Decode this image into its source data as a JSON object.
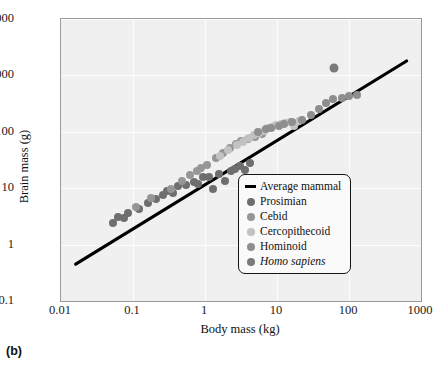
{
  "panel_label": "(b)",
  "chart_data": {
    "type": "scatter",
    "title": "",
    "xlabel": "Body mass (kg)",
    "ylabel": "Brain mass (g)",
    "xscale": "log",
    "yscale": "log",
    "xlim": [
      0.01,
      1000
    ],
    "ylim": [
      0.1,
      10000
    ],
    "xticks": [
      "0.01",
      "0.1",
      "1",
      "10",
      "100",
      "1000"
    ],
    "xtick_values": [
      0.01,
      0.1,
      1,
      10,
      100,
      1000
    ],
    "yticks": [
      "0.1",
      "1",
      "10",
      "100",
      "1,000",
      "10,000"
    ],
    "ytick_values": [
      0.1,
      1,
      10,
      100,
      1000,
      10000
    ],
    "grid": true,
    "legend_position": "bottom-right",
    "legend": [
      {
        "label": "Average mammal",
        "marker": "line",
        "color": "#000000"
      },
      {
        "label": "Prosimian",
        "marker": "circle",
        "color": "#6e6e6e"
      },
      {
        "label": "Cebid",
        "marker": "circle",
        "color": "#969696"
      },
      {
        "label": "Cercopithecoid",
        "marker": "circle",
        "color": "#c2c2c2"
      },
      {
        "label": "Hominoid",
        "marker": "circle",
        "color": "#8e8e8e"
      },
      {
        "label": "Homo sapiens",
        "marker": "circle",
        "color": "#7a7a7a",
        "italic": true
      }
    ],
    "trendline": {
      "name": "Average mammal",
      "color": "#000000",
      "x": [
        0.016,
        631
      ],
      "y": [
        0.45,
        1800
      ]
    },
    "series": [
      {
        "name": "Prosimian",
        "color": "#6e6e6e",
        "points": [
          [
            0.052,
            2.4
          ],
          [
            0.061,
            3.1
          ],
          [
            0.075,
            3.0
          ],
          [
            0.085,
            3.6
          ],
          [
            0.12,
            4.2
          ],
          [
            0.16,
            5.5
          ],
          [
            0.21,
            6.4
          ],
          [
            0.26,
            7.6
          ],
          [
            0.3,
            9.0
          ],
          [
            0.36,
            8.3
          ],
          [
            0.42,
            11.0
          ],
          [
            0.55,
            11.5
          ],
          [
            0.7,
            13.0
          ],
          [
            0.8,
            12.0
          ],
          [
            0.95,
            15.5
          ],
          [
            1.15,
            16.0
          ],
          [
            1.3,
            9.5
          ],
          [
            1.55,
            18.0
          ],
          [
            1.9,
            13.5
          ],
          [
            2.3,
            20.0
          ],
          [
            2.6,
            22.0
          ],
          [
            3.1,
            25.0
          ],
          [
            3.6,
            21.0
          ],
          [
            4.2,
            28.0
          ]
        ]
      },
      {
        "name": "Cebid",
        "color": "#969696",
        "points": [
          [
            0.11,
            4.6
          ],
          [
            0.18,
            6.8
          ],
          [
            0.34,
            9.5
          ],
          [
            0.48,
            13.5
          ],
          [
            0.62,
            17.0
          ],
          [
            0.78,
            20.0
          ],
          [
            0.88,
            23.0
          ],
          [
            1.05,
            26.0
          ],
          [
            1.4,
            34.0
          ],
          [
            1.8,
            42.0
          ],
          [
            2.2,
            52.0
          ],
          [
            2.7,
            60.0
          ],
          [
            3.2,
            68.0
          ],
          [
            3.9,
            74.0
          ],
          [
            5.0,
            82.0
          ],
          [
            6.2,
            90.0
          ]
        ]
      },
      {
        "name": "Cercopithecoid",
        "color": "#c2c2c2",
        "points": [
          [
            1.6,
            38.0
          ],
          [
            2.1,
            48.0
          ],
          [
            2.8,
            58.0
          ],
          [
            3.4,
            66.0
          ],
          [
            4.1,
            78.0
          ],
          [
            4.8,
            88.0
          ],
          [
            5.6,
            96.0
          ],
          [
            6.5,
            105.0
          ],
          [
            7.4,
            115.0
          ],
          [
            8.6,
            122.0
          ],
          [
            9.8,
            130.0
          ],
          [
            11.5,
            135.0
          ],
          [
            13.0,
            142.0
          ],
          [
            15.0,
            150.0
          ],
          [
            17.5,
            128.0
          ],
          [
            20.0,
            155.0
          ]
        ]
      },
      {
        "name": "Hominoid",
        "color": "#8e8e8e",
        "points": [
          [
            5.4,
            98.0
          ],
          [
            7.0,
            110.0
          ],
          [
            8.2,
            118.0
          ],
          [
            10.5,
            126.0
          ],
          [
            12.5,
            140.0
          ],
          [
            16.0,
            152.0
          ],
          [
            22.0,
            165.0
          ],
          [
            30.0,
            200.0
          ],
          [
            38.0,
            250.0
          ],
          [
            48.0,
            320.0
          ],
          [
            60.0,
            380.0
          ],
          [
            80.0,
            400.0
          ],
          [
            100.0,
            430.0
          ],
          [
            130.0,
            450.0
          ]
        ]
      },
      {
        "name": "Homo sapiens",
        "color": "#7a7a7a",
        "points": [
          [
            62.0,
            1330.0
          ]
        ]
      }
    ]
  }
}
